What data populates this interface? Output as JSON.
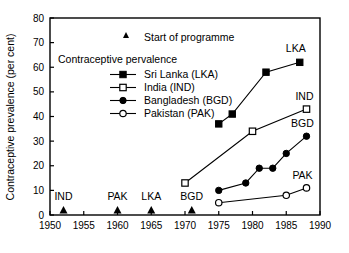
{
  "chart_data": {
    "type": "line",
    "title": "",
    "xlabel": "",
    "ylabel": "Contraceptive prevalence (per cent)",
    "xlim": [
      1950,
      1990
    ],
    "ylim": [
      0,
      80
    ],
    "xticks": [
      1950,
      1955,
      1960,
      1965,
      1970,
      1975,
      1980,
      1985,
      1990
    ],
    "yticks": [
      0,
      10,
      20,
      30,
      40,
      50,
      60,
      70,
      80
    ],
    "grid": false,
    "legend_position": "upper-left-inside",
    "legend_title": "Contraceptive pervalence",
    "marker_legend": {
      "label": "Start of programme",
      "marker": "filled-triangle"
    },
    "series": [
      {
        "name": "Sri Lanka (LKA)",
        "code": "LKA",
        "marker": "filled-square",
        "x": [
          1975,
          1977,
          1982,
          1987
        ],
        "values": [
          37,
          41,
          58,
          62
        ],
        "end_label": "LKA"
      },
      {
        "name": "India (IND)",
        "code": "IND",
        "marker": "open-square",
        "x": [
          1970,
          1980,
          1988
        ],
        "values": [
          13,
          34,
          43
        ],
        "end_label": "IND"
      },
      {
        "name": "Bangladesh (BGD)",
        "code": "BGD",
        "marker": "filled-circle",
        "x": [
          1975,
          1979,
          1981,
          1983,
          1985,
          1988
        ],
        "values": [
          10,
          13,
          19,
          19,
          25,
          32
        ],
        "end_label": "BGD"
      },
      {
        "name": "Pakistan (PAK)",
        "code": "PAK",
        "marker": "open-circle",
        "x": [
          1975,
          1985,
          1988
        ],
        "values": [
          5,
          8,
          11
        ],
        "end_label": "PAK"
      }
    ],
    "programme_starts": [
      {
        "code": "IND",
        "year": 1952
      },
      {
        "code": "PAK",
        "year": 1960
      },
      {
        "code": "LKA",
        "year": 1965
      },
      {
        "code": "BGD",
        "year": 1971
      }
    ]
  },
  "axis": {
    "ylabel": "Contraceptive prevalence (per cent)",
    "yticks": [
      "0",
      "10",
      "20",
      "30",
      "40",
      "50",
      "60",
      "70",
      "80"
    ],
    "xticks": [
      "1950",
      "1955",
      "1960",
      "1965",
      "1970",
      "1975",
      "1980",
      "1985",
      "1990"
    ]
  },
  "legend": {
    "marker_entry": "Start of programme",
    "title": "Contraceptive pervalence",
    "entries": [
      "Sri Lanka (LKA)",
      "India (IND)",
      "Bangladesh (BGD)",
      "Pakistan (PAK)"
    ]
  },
  "series_end_labels": [
    "LKA",
    "IND",
    "BGD",
    "PAK"
  ],
  "programme_labels": [
    "IND",
    "PAK",
    "LKA",
    "BGD"
  ],
  "colors": {
    "ink": "#000000",
    "background": "#ffffff"
  }
}
